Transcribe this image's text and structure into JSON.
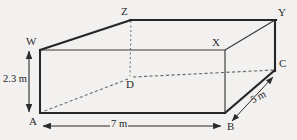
{
  "figure": {
    "type": "3d-cuboid-solid-geometry",
    "background_color": "#f2f1ef",
    "line_color": "#2b2b2b",
    "hidden_line_color": "#6f6f6f",
    "vertices": [
      {
        "name": "A",
        "label": "A",
        "x": 40,
        "y": 113,
        "position": "front-bottom-left",
        "hidden": false,
        "label_dx": -11,
        "label_dy": 3
      },
      {
        "name": "B",
        "label": "B",
        "x": 225,
        "y": 113,
        "position": "front-bottom-right",
        "hidden": false,
        "label_dx": 2,
        "label_dy": 8
      },
      {
        "name": "W",
        "label": "W",
        "x": 40,
        "y": 50,
        "position": "front-top-left",
        "hidden": false,
        "label_dx": -13,
        "label_dy": -13
      },
      {
        "name": "X",
        "label": "X",
        "x": 225,
        "y": 50,
        "position": "front-top-right",
        "hidden": false,
        "label_dx": -12,
        "label_dy": -13
      },
      {
        "name": "Z",
        "label": "Z",
        "x": 131,
        "y": 20,
        "position": "back-top-left",
        "hidden": false,
        "label_dx": -10,
        "label_dy": -13
      },
      {
        "name": "Y",
        "label": "Y",
        "x": 275,
        "y": 20,
        "position": "back-top-right",
        "hidden": false,
        "label_dx": 3,
        "label_dy": -13
      },
      {
        "name": "C",
        "label": "C",
        "x": 275,
        "y": 70,
        "position": "back-bottom-right",
        "hidden": false,
        "label_dx": 3,
        "label_dy": -12
      },
      {
        "name": "D",
        "label": "D",
        "x": 130,
        "y": 78,
        "position": "back-bottom-left",
        "hidden": true,
        "label_dx": -3,
        "label_dy": 2
      }
    ],
    "edges": [
      {
        "from": "A",
        "to": "B",
        "style": "solid",
        "weight": "thick",
        "name": "edge-a-b-front-bottom"
      },
      {
        "from": "A",
        "to": "W",
        "style": "solid",
        "weight": "thick",
        "name": "edge-a-w-front-left"
      },
      {
        "from": "W",
        "to": "Z",
        "style": "solid",
        "weight": "thick",
        "name": "edge-w-z-top-left-slant"
      },
      {
        "from": "Z",
        "to": "Y",
        "style": "solid",
        "weight": "thick",
        "name": "edge-z-y-top-back"
      },
      {
        "from": "Y",
        "to": "C",
        "style": "solid",
        "weight": "thick",
        "name": "edge-y-c-right-back"
      },
      {
        "from": "B",
        "to": "C",
        "style": "solid",
        "weight": "thick",
        "name": "edge-b-c-bottom-right-slant"
      },
      {
        "from": "W",
        "to": "X",
        "style": "solid",
        "weight": "thin",
        "name": "edge-w-x-top-front"
      },
      {
        "from": "X",
        "to": "B",
        "style": "solid",
        "weight": "thin",
        "name": "edge-x-b-front-right"
      },
      {
        "from": "X",
        "to": "Y",
        "style": "solid",
        "weight": "thin",
        "name": "edge-x-y-top-right-slant"
      },
      {
        "from": "Z",
        "to": "D",
        "style": "dashed",
        "weight": "thin",
        "name": "edge-z-d-hidden-vertical"
      },
      {
        "from": "D",
        "to": "A",
        "style": "dashed",
        "weight": "thin",
        "name": "edge-d-a-hidden-slant"
      },
      {
        "from": "D",
        "to": "C",
        "style": "dashed",
        "weight": "thin",
        "name": "edge-d-c-hidden-bottom-back"
      }
    ],
    "dimensions": [
      {
        "name": "height",
        "value": "2.3 m",
        "numeric": 2.3,
        "unit": "m",
        "orientation": "vertical",
        "between": [
          "A",
          "W"
        ],
        "arrow": {
          "x1": 29,
          "y1": 50,
          "x2": 29,
          "y2": 113
        },
        "label_x": 2,
        "label_y": 76
      },
      {
        "name": "length",
        "value": "7 m",
        "numeric": 7,
        "unit": "m",
        "orientation": "horizontal",
        "between": [
          "A",
          "B"
        ],
        "arrow": {
          "x1": 42,
          "y1": 126,
          "x2": 222,
          "y2": 126
        },
        "label_x": 119,
        "label_y": 120
      },
      {
        "name": "width",
        "value": "5 m",
        "numeric": 5,
        "unit": "m",
        "orientation": "diagonal",
        "between": [
          "B",
          "C"
        ],
        "arrow": {
          "x1": 231,
          "y1": 122,
          "x2": 274,
          "y2": 76
        },
        "label_x": 253,
        "label_y": 96
      }
    ]
  }
}
